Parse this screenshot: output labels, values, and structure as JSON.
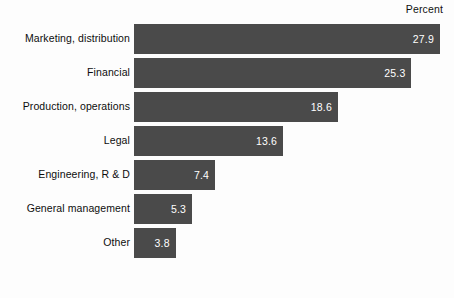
{
  "header": {
    "percent_label": "Percent"
  },
  "footnote": {
    "text": ""
  },
  "colors": {
    "bar": "#4a4a4a",
    "background": "#fdfdfd",
    "label_text": "#0d0d0d",
    "value_text": "#ffffff"
  },
  "chart_data": {
    "type": "bar",
    "orientation": "horizontal",
    "title": "",
    "subtitle": "",
    "xlabel": "Percent",
    "ylabel": "",
    "grid": false,
    "legend": null,
    "xlim": [
      0,
      27.9
    ],
    "categories": [
      "Marketing, distribution",
      "Financial",
      "Production, operations",
      "Legal",
      "Engineering, R & D",
      "General management",
      "Other"
    ],
    "values": [
      27.9,
      25.3,
      18.6,
      13.6,
      7.4,
      5.3,
      3.8
    ],
    "value_labels": [
      "27.9",
      "25.3",
      "18.6",
      "13.6",
      "7.4",
      "5.3",
      "3.8"
    ],
    "bars": [
      {
        "category": "Marketing, distribution",
        "value": 27.9,
        "label": "27.9"
      },
      {
        "category": "Financial",
        "value": 25.3,
        "label": "25.3"
      },
      {
        "category": "Production, operations",
        "value": 18.6,
        "label": "18.6"
      },
      {
        "category": "Legal",
        "value": 13.6,
        "label": "13.6"
      },
      {
        "category": "Engineering, R & D",
        "value": 7.4,
        "label": "7.4"
      },
      {
        "category": "General management",
        "value": 5.3,
        "label": "5.3"
      },
      {
        "category": "Other",
        "value": 3.8,
        "label": "3.8"
      }
    ]
  }
}
